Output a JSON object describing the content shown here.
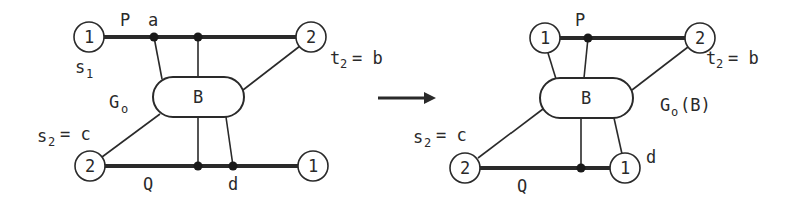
{
  "left_graph": {
    "name": "G_o",
    "label_main": "G",
    "label_sub": "o",
    "block_label": "B",
    "nodes": {
      "top_left": "1",
      "top_right": "2",
      "bottom_left": "2",
      "bottom_right": "1"
    },
    "labels": {
      "P": "P",
      "a": "a",
      "s1_main": "s",
      "s1_sub": "1",
      "t2_main": "t",
      "t2_sub": "2",
      "t2_eq": "= b",
      "s2_main": "s",
      "s2_sub": "2",
      "s2_eq": "= c",
      "Q": "Q",
      "d": "d"
    }
  },
  "arrow": {
    "direction": "right"
  },
  "right_graph": {
    "name": "G_o(B)",
    "label_main": "G",
    "label_sub": "o",
    "label_suffix": "(B)",
    "block_label": "B",
    "nodes": {
      "top_left": "1",
      "top_right": "2",
      "bottom_left": "2",
      "bottom_right": "1"
    },
    "labels": {
      "P": "P",
      "t2_main": "t",
      "t2_sub": "2",
      "t2_eq": "= b",
      "s2_main": "s",
      "s2_sub": "2",
      "s2_eq": "= c",
      "Q": "Q",
      "d": "d"
    }
  },
  "colors": {
    "ink": "#2a2a2a",
    "background": "#ffffff"
  }
}
